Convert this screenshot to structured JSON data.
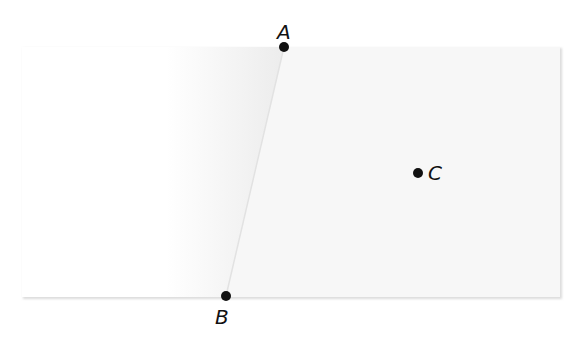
{
  "diagram": {
    "sheet": {
      "x": 22,
      "y": 47,
      "width": 538,
      "height": 250,
      "fill": "#f7f7f7",
      "edge_color": "#d9d9d9"
    },
    "fold_line": {
      "from": "A",
      "to": "B",
      "color": "#e3e3e3"
    },
    "points": [
      {
        "id": "A",
        "label": "A",
        "x": 284,
        "y": 47,
        "label_x": 277,
        "label_y": 39
      },
      {
        "id": "B",
        "label": "B",
        "x": 226,
        "y": 296,
        "label_x": 215,
        "label_y": 324
      },
      {
        "id": "C",
        "label": "C",
        "x": 418,
        "y": 173,
        "label_x": 428,
        "label_y": 180
      }
    ],
    "colors": {
      "point": "#111111",
      "shadow": "#e6e6e6"
    }
  }
}
